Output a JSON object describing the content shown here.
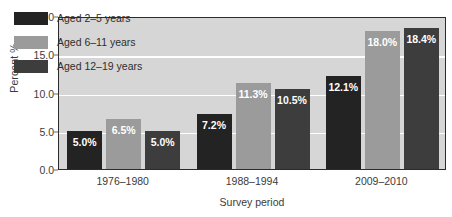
{
  "chart_data": {
    "type": "bar",
    "title": "",
    "xlabel": "Survey period",
    "ylabel": "Percent %",
    "categories": [
      "1976–1980",
      "1988–1994",
      "2009–2010"
    ],
    "series": [
      {
        "name": "Aged 2–5 years",
        "color": "#232323",
        "values": [
          5.0,
          7.2,
          12.1
        ],
        "labels": [
          "5.0%",
          "7.2%",
          "12.1%"
        ]
      },
      {
        "name": "Aged 6–11 years",
        "color": "#9b9b9b",
        "values": [
          6.5,
          11.3,
          18.0
        ],
        "labels": [
          "6.5%",
          "11.3%",
          "18.0%"
        ]
      },
      {
        "name": "Aged 12–19 years",
        "color": "#3d3d3d",
        "values": [
          5.0,
          10.5,
          18.4
        ],
        "labels": [
          "5.0%",
          "10.5%",
          "18.4%"
        ]
      }
    ],
    "ylim": [
      0.0,
      20.0
    ],
    "yticks": [
      0.0,
      5.0,
      10.0,
      15.0,
      20.0
    ],
    "ytick_labels": [
      "0.0",
      "5.0",
      "10.0",
      "15.0",
      "20.0"
    ],
    "grid": true,
    "gridlines_at": [
      5.0,
      10.0,
      15.0
    ],
    "legend_position": "top-left",
    "plot_background": "#d6d6d6",
    "gridline_color": "#ffffff",
    "frame_color": "#2b2b2b",
    "text_color": "#3b3b3b",
    "label_color": "#ffffff"
  }
}
